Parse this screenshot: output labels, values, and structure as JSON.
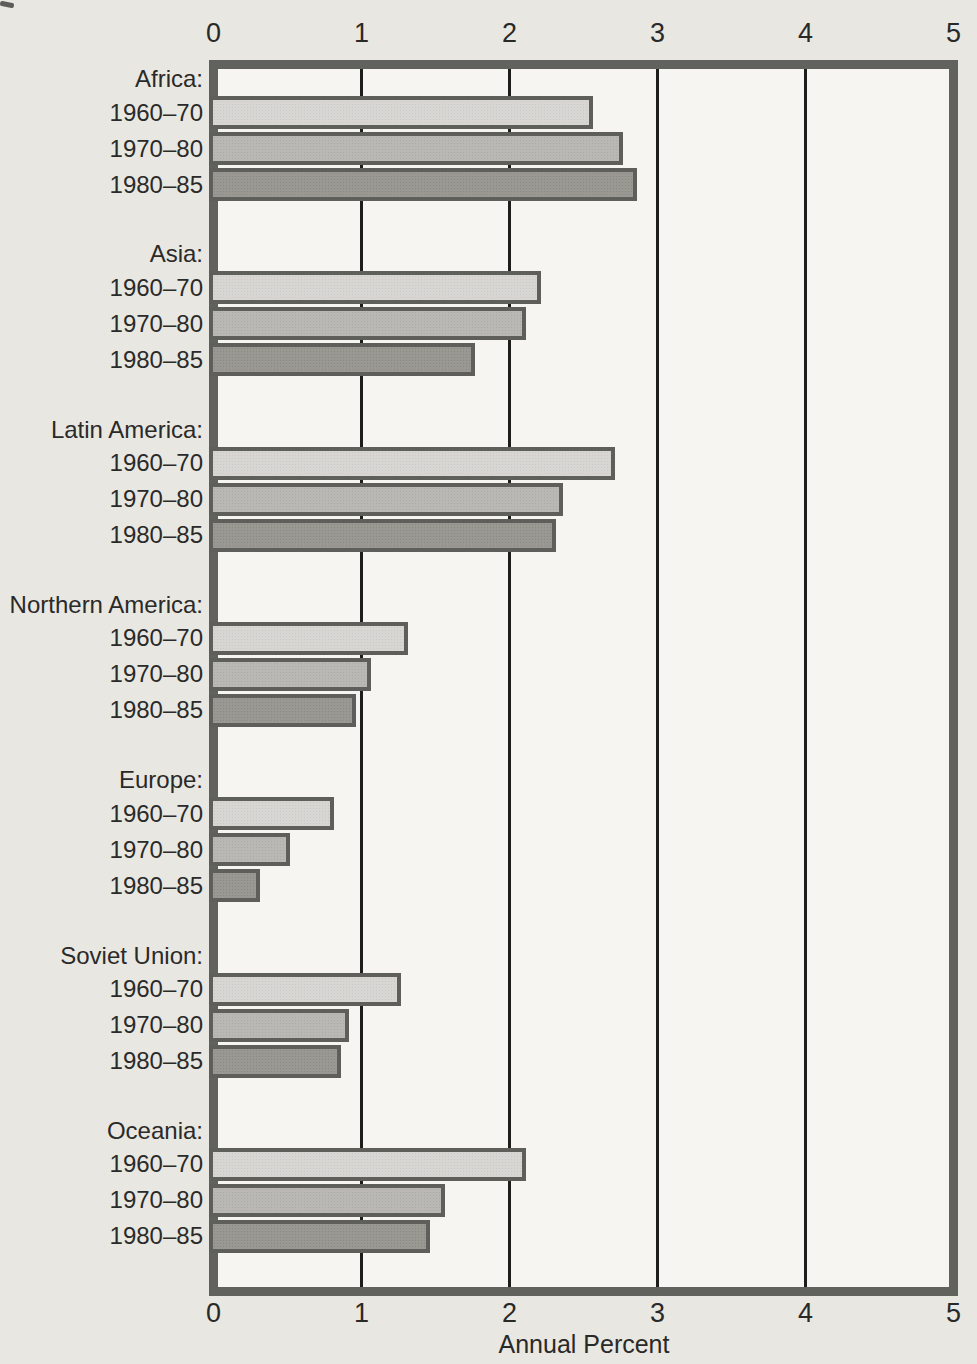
{
  "colors": {
    "page_background": "#e9e7e2",
    "plot_background": "#f6f5f1",
    "frame_border": "#61615e",
    "bar_border": "#5e5e5b",
    "gridline": "#1d1d1b",
    "text": "#292928",
    "series_fills": [
      "#d7d6d3",
      "#b9b8b4",
      "#999893"
    ]
  },
  "chart_data": {
    "type": "bar",
    "orientation": "horizontal",
    "title": "",
    "xlabel": "Annual Percent",
    "ylabel": "",
    "xlim": [
      0,
      5
    ],
    "x_tick_labels": [
      "0",
      "1",
      "2",
      "3",
      "4",
      "5"
    ],
    "x_tick_values": [
      0,
      1,
      2,
      3,
      4,
      5
    ],
    "gridlines_at": [
      1,
      2,
      3,
      4
    ],
    "grid": true,
    "axis_labels_positions": [
      "top",
      "bottom"
    ],
    "categories": [
      "Africa",
      "Asia",
      "Latin America",
      "Northern America",
      "Europe",
      "Soviet Union",
      "Oceania"
    ],
    "category_labels": [
      "Africa:",
      "Asia:",
      "Latin America:",
      "Northern America:",
      "Europe:",
      "Soviet Union:",
      "Oceania:"
    ],
    "series": [
      {
        "name": "1960–70",
        "values": [
          2.55,
          2.2,
          2.7,
          1.3,
          0.8,
          1.25,
          2.1
        ]
      },
      {
        "name": "1970–80",
        "values": [
          2.75,
          2.1,
          2.35,
          1.05,
          0.5,
          0.9,
          1.55
        ]
      },
      {
        "name": "1980–85",
        "values": [
          2.85,
          1.75,
          2.3,
          0.95,
          0.3,
          0.85,
          1.45
        ]
      }
    ],
    "legend": "none",
    "units": "percent"
  }
}
